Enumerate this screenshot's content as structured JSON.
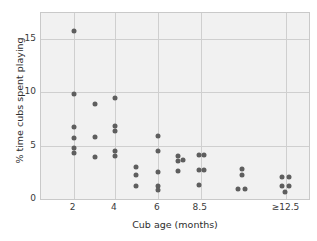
{
  "chart_data": {
    "type": "scatter",
    "title": "",
    "xlabel": "Cub age (months)",
    "ylabel": "% time cubs spent playing",
    "grid": true,
    "legend": null,
    "xlim": [
      0,
      10
    ],
    "ylim": [
      0,
      17.4
    ],
    "x_categories": [
      "2",
      "4",
      "6",
      "8.5",
      "≥12.5"
    ],
    "x_category_positions": [
      1.22,
      2.76,
      4.36,
      5.96,
      9.16
    ],
    "y_ticks": [
      0,
      5,
      10,
      15
    ],
    "y_tick_labels": [
      "0",
      "5",
      "10",
      "15"
    ],
    "points": [
      {
        "x": 1.22,
        "y": 15.7
      },
      {
        "x": 1.22,
        "y": 9.8
      },
      {
        "x": 1.22,
        "y": 6.7
      },
      {
        "x": 1.22,
        "y": 5.7
      },
      {
        "x": 1.22,
        "y": 4.8
      },
      {
        "x": 1.22,
        "y": 4.35
      },
      {
        "x": 2.0,
        "y": 8.9
      },
      {
        "x": 2.0,
        "y": 5.8
      },
      {
        "x": 2.0,
        "y": 3.9
      },
      {
        "x": 2.76,
        "y": 9.45
      },
      {
        "x": 2.76,
        "y": 6.85
      },
      {
        "x": 2.76,
        "y": 6.35
      },
      {
        "x": 2.76,
        "y": 4.45
      },
      {
        "x": 2.76,
        "y": 4.05
      },
      {
        "x": 3.56,
        "y": 3.0
      },
      {
        "x": 3.56,
        "y": 2.2
      },
      {
        "x": 3.56,
        "y": 1.2
      },
      {
        "x": 4.36,
        "y": 5.85
      },
      {
        "x": 4.36,
        "y": 4.5
      },
      {
        "x": 4.36,
        "y": 2.5
      },
      {
        "x": 4.36,
        "y": 1.2
      },
      {
        "x": 4.36,
        "y": 0.8
      },
      {
        "x": 5.1,
        "y": 4.0
      },
      {
        "x": 5.28,
        "y": 3.65
      },
      {
        "x": 5.1,
        "y": 3.6
      },
      {
        "x": 5.1,
        "y": 2.6
      },
      {
        "x": 5.88,
        "y": 4.1
      },
      {
        "x": 6.1,
        "y": 4.1
      },
      {
        "x": 5.88,
        "y": 2.7
      },
      {
        "x": 6.1,
        "y": 2.7
      },
      {
        "x": 5.88,
        "y": 1.3
      },
      {
        "x": 7.5,
        "y": 2.8
      },
      {
        "x": 7.5,
        "y": 2.2
      },
      {
        "x": 7.35,
        "y": 0.95
      },
      {
        "x": 7.62,
        "y": 0.95
      },
      {
        "x": 9.0,
        "y": 2.1
      },
      {
        "x": 9.25,
        "y": 2.1
      },
      {
        "x": 9.0,
        "y": 1.25
      },
      {
        "x": 9.25,
        "y": 1.25
      },
      {
        "x": 9.12,
        "y": 0.65
      }
    ],
    "marker": {
      "shape": "circle",
      "color": "#5e5e5e",
      "size": 5
    },
    "colors": {
      "panel_background": "#f1f1f1",
      "gridline": "#cfcfcf",
      "panel_border": "#c9c9c9",
      "text": "#2d2d2d",
      "figure_background": "#ffffff"
    }
  }
}
